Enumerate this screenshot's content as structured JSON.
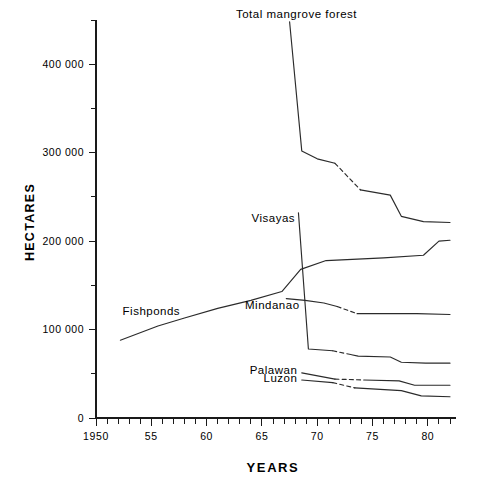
{
  "figure": {
    "faint_top_text": "",
    "background_color": "#ffffff",
    "line_color": "#2b2b2b"
  },
  "axes": {
    "y_title": "HECTARES",
    "x_title": "YEARS",
    "y_ticks": [
      {
        "value": 0,
        "label": "0"
      },
      {
        "value": 50000,
        "label": ""
      },
      {
        "value": 100000,
        "label": "100 000"
      },
      {
        "value": 150000,
        "label": ""
      },
      {
        "value": 200000,
        "label": "200 000"
      },
      {
        "value": 250000,
        "label": ""
      },
      {
        "value": 300000,
        "label": "300 000"
      },
      {
        "value": 350000,
        "label": ""
      },
      {
        "value": 400000,
        "label": "400 000"
      },
      {
        "value": 450000,
        "label": ""
      }
    ],
    "x_ticks": [
      {
        "value": 1950,
        "label": "1950"
      },
      {
        "value": 1955,
        "label": "55"
      },
      {
        "value": 1960,
        "label": "60"
      },
      {
        "value": 1965,
        "label": "65"
      },
      {
        "value": 1970,
        "label": "70"
      },
      {
        "value": 1975,
        "label": "75"
      },
      {
        "value": 1980,
        "label": "80"
      }
    ]
  },
  "chart_data": {
    "type": "line",
    "title": "",
    "xlabel": "YEARS",
    "ylabel": "HECTARES",
    "xlim": [
      1950,
      1982
    ],
    "ylim": [
      0,
      450000
    ],
    "grid": false,
    "legend": "inline-labels",
    "series": [
      {
        "name": "Total mangrove forest",
        "label": "Total mangrove forest",
        "label_anchor": "end",
        "label_x": 1973.6,
        "label_y": 452000,
        "points": [
          {
            "x": 1967.5,
            "y": 448000
          },
          {
            "x": 1968.6,
            "y": 302000
          },
          {
            "x": 1970.0,
            "y": 293000
          },
          {
            "x": 1971.6,
            "y": 288000
          },
          {
            "x": 1973.9,
            "y": 258000
          },
          {
            "x": 1976.6,
            "y": 252000
          },
          {
            "x": 1977.6,
            "y": 228000
          },
          {
            "x": 1979.6,
            "y": 222000
          },
          {
            "x": 1982.0,
            "y": 221000
          }
        ],
        "dashed_from": 1971.6,
        "dashed_to": 1973.9
      },
      {
        "name": "Fishponds",
        "label": "Fishponds",
        "label_anchor": "start",
        "label_x": 1952.4,
        "label_y": 117000,
        "points": [
          {
            "x": 1952.2,
            "y": 88000
          },
          {
            "x": 1955.6,
            "y": 104000
          },
          {
            "x": 1958.0,
            "y": 113000
          },
          {
            "x": 1961.0,
            "y": 124000
          },
          {
            "x": 1964.0,
            "y": 133000
          },
          {
            "x": 1966.8,
            "y": 143000
          },
          {
            "x": 1968.5,
            "y": 168000
          },
          {
            "x": 1970.8,
            "y": 178000
          },
          {
            "x": 1976.0,
            "y": 181000
          },
          {
            "x": 1979.6,
            "y": 184000
          },
          {
            "x": 1981.0,
            "y": 200000
          },
          {
            "x": 1982.0,
            "y": 201000
          }
        ]
      },
      {
        "name": "Visayas",
        "label": "Visayas",
        "label_anchor": "end",
        "label_x": 1968.0,
        "label_y": 222000,
        "points": [
          {
            "x": 1968.3,
            "y": 232000
          },
          {
            "x": 1969.2,
            "y": 78000
          },
          {
            "x": 1971.4,
            "y": 76000
          },
          {
            "x": 1973.7,
            "y": 70000
          },
          {
            "x": 1976.6,
            "y": 69000
          },
          {
            "x": 1977.6,
            "y": 63000
          },
          {
            "x": 1979.8,
            "y": 62000
          },
          {
            "x": 1982.0,
            "y": 62000
          }
        ],
        "dashed_from": 1971.4,
        "dashed_to": 1973.1
      },
      {
        "name": "Mindanao",
        "label": "Mindanao",
        "label_anchor": "end",
        "label_x": 1968.4,
        "label_y": 123000,
        "points": [
          {
            "x": 1967.2,
            "y": 135000
          },
          {
            "x": 1968.9,
            "y": 133000
          },
          {
            "x": 1970.6,
            "y": 130000
          },
          {
            "x": 1971.8,
            "y": 126000
          },
          {
            "x": 1973.6,
            "y": 118000
          },
          {
            "x": 1979.0,
            "y": 118000
          },
          {
            "x": 1982.0,
            "y": 117000
          }
        ],
        "dashed_from": 1971.8,
        "dashed_to": 1973.6
      },
      {
        "name": "Palawan",
        "label": "Palawan",
        "label_anchor": "end",
        "label_x": 1968.2,
        "label_y": 50000,
        "points": [
          {
            "x": 1968.6,
            "y": 51000
          },
          {
            "x": 1971.6,
            "y": 44000
          },
          {
            "x": 1974.2,
            "y": 43000
          },
          {
            "x": 1977.4,
            "y": 42000
          },
          {
            "x": 1978.8,
            "y": 37000
          },
          {
            "x": 1982.0,
            "y": 37000
          }
        ],
        "dashed_from": 1971.6,
        "dashed_to": 1974.2
      },
      {
        "name": "Luzon",
        "label": "Luzon",
        "label_anchor": "end",
        "label_x": 1968.2,
        "label_y": 41000,
        "points": [
          {
            "x": 1968.6,
            "y": 43000
          },
          {
            "x": 1971.4,
            "y": 40000
          },
          {
            "x": 1973.4,
            "y": 34000
          },
          {
            "x": 1977.6,
            "y": 31000
          },
          {
            "x": 1979.4,
            "y": 25000
          },
          {
            "x": 1982.0,
            "y": 24000
          }
        ],
        "dashed_from": 1971.4,
        "dashed_to": 1973.4
      }
    ]
  }
}
